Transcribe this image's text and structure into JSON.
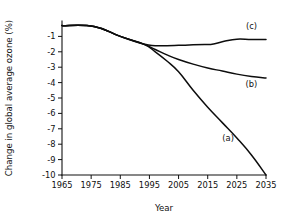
{
  "chart_data": {
    "type": "line",
    "title": "",
    "xlabel": "Year",
    "ylabel": "Change in global average ozone (%)",
    "xlim": [
      1965,
      2035
    ],
    "ylim": [
      -10,
      0
    ],
    "grid": false,
    "legend": "inline-labels",
    "x_ticks": [
      1965,
      1975,
      1985,
      1995,
      2005,
      2015,
      2025,
      2035
    ],
    "x_tick_labels": [
      "1965",
      "1975",
      "1985",
      "1995",
      "2005",
      "2015",
      "2025",
      "2035"
    ],
    "y_ticks": [
      -1,
      -2,
      -3,
      -4,
      -5,
      -6,
      -7,
      -8,
      -9,
      -10
    ],
    "y_tick_labels": [
      "-1",
      "-2",
      "-3",
      "-4",
      "-5",
      "-6",
      "-7",
      "-8",
      "-9",
      "-10"
    ],
    "series": [
      {
        "name": "(a)",
        "label": "(a)",
        "label_x": 2022,
        "label_y": -7.8,
        "color": "#0d0d0d",
        "x": [
          1965,
          1976,
          1985,
          1993,
          1997,
          2001,
          2005,
          2010,
          2015,
          2020,
          2025,
          2030,
          2035
        ],
        "values": [
          -0.3,
          -0.35,
          -1.0,
          -1.5,
          -2.0,
          -2.6,
          -3.3,
          -4.5,
          -5.6,
          -6.6,
          -7.6,
          -8.7,
          -10.0
        ]
      },
      {
        "name": "(b)",
        "label": "(b)",
        "label_x": 2030,
        "label_y": -4.3,
        "color": "#0d0d0d",
        "x": [
          1965,
          1976,
          1985,
          1993,
          1997,
          2001,
          2005,
          2010,
          2015,
          2020,
          2025,
          2030,
          2035
        ],
        "values": [
          -0.3,
          -0.35,
          -1.0,
          -1.5,
          -1.85,
          -2.2,
          -2.5,
          -2.8,
          -3.05,
          -3.25,
          -3.45,
          -3.6,
          -3.7
        ]
      },
      {
        "name": "(c)",
        "label": "(c)",
        "label_x": 2030,
        "label_y": -0.55,
        "color": "#0d0d0d",
        "x": [
          1965,
          1976,
          1985,
          1993,
          1997,
          2001,
          2005,
          2010,
          2015,
          2017,
          2021,
          2025,
          2030,
          2035
        ],
        "values": [
          -0.3,
          -0.35,
          -1.0,
          -1.5,
          -1.6,
          -1.6,
          -1.58,
          -1.55,
          -1.52,
          -1.5,
          -1.3,
          -1.18,
          -1.2,
          -1.2
        ]
      }
    ]
  },
  "geometry": {
    "plot_left": 62,
    "plot_right": 266,
    "plot_top": 21,
    "plot_bottom": 175,
    "y_axis_top_value": 0.0,
    "y_axis_bottom_value": -10.0,
    "x_axis_left_value": 1965,
    "x_axis_right_value": 2035,
    "tick_len": 4
  }
}
